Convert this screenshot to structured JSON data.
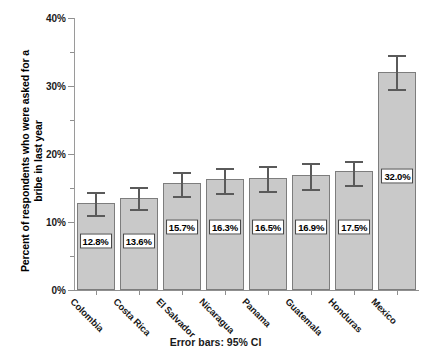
{
  "chart_data": {
    "type": "bar",
    "title": "",
    "xlabel": "",
    "ylabel_line1": "Percent of respondents who were asked for a",
    "ylabel_line2": "bribe in last year",
    "ylim": [
      0,
      40
    ],
    "ytick_labels": [
      "0%",
      "10%",
      "20%",
      "30%",
      "40%"
    ],
    "ytick_values": [
      0,
      10,
      20,
      30,
      40
    ],
    "yminor_values": [
      5,
      15,
      25,
      35
    ],
    "grid": false,
    "legend": "none",
    "annotation": "Error bars: 95% CI",
    "categories": [
      "Colombia",
      "Costa Rica",
      "El Salvador",
      "Nicaragua",
      "Panama",
      "Guatemala",
      "Honduras",
      "Mexico"
    ],
    "values": [
      12.8,
      13.6,
      15.7,
      16.3,
      16.5,
      16.9,
      17.5,
      32.0
    ],
    "value_labels": [
      "12.8%",
      "13.6%",
      "15.7%",
      "16.3%",
      "16.5%",
      "16.9%",
      "17.5%",
      "32.0%"
    ],
    "error_low": [
      11.1,
      11.9,
      13.8,
      14.2,
      14.5,
      14.9,
      15.4,
      29.6
    ],
    "error_high": [
      14.4,
      15.2,
      17.3,
      17.9,
      18.2,
      18.7,
      19.0,
      34.5
    ],
    "label_y_positions": [
      7.2,
      7.2,
      9.3,
      9.3,
      9.3,
      9.3,
      9.3,
      16.7
    ],
    "colors": {
      "bar_fill": "#c9c9c9",
      "bar_border": "#7d7d7d",
      "error_bar": "#5a5a5a",
      "axis": "#8f8f8f",
      "text": "#1a1a1a",
      "background": "#ffffff",
      "label_box_fill": "#ffffff",
      "label_box_border": "#444444"
    }
  }
}
